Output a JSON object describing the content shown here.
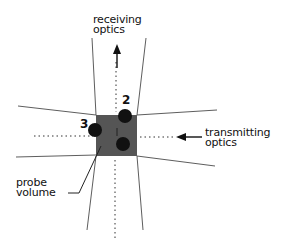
{
  "diagram": {
    "labels": {
      "receiving": [
        "receiving",
        "optics"
      ],
      "transmitting": [
        "transmitting",
        "optics"
      ],
      "probe": [
        "probe",
        "volume"
      ]
    },
    "particles": [
      {
        "id": "1",
        "cx": 123,
        "cy": 144
      },
      {
        "id": "2",
        "cx": 125,
        "cy": 116
      },
      {
        "id": "3",
        "cx": 95,
        "cy": 130
      }
    ],
    "colors": {
      "probe_volume": "#555555",
      "particle": "#111111",
      "line": "#333333"
    }
  }
}
